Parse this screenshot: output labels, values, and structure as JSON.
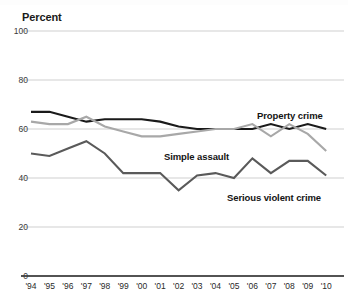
{
  "axis": {
    "ylabel": "Percent",
    "yticks": [
      100,
      80,
      60,
      40,
      20,
      0
    ],
    "xticks": [
      "'94",
      "'95",
      "'96",
      "'97",
      "'98",
      "'99",
      "'00",
      "'01",
      "'02",
      "'03",
      "'04",
      "'05",
      "'06",
      "'07",
      "'08",
      "'09",
      "'10"
    ]
  },
  "labels": {
    "property_crime": "Property crime",
    "simple_assault": "Simple assault",
    "serious_violent_crime": "Serious violent crime"
  },
  "colors": {
    "property_crime": "#1a1a1a",
    "simple_assault": "#a8a8a8",
    "serious_violent_crime": "#5a5a5a",
    "gridline": "#c9c9c9",
    "axis": "#1a1a1a"
  },
  "chart_data": {
    "type": "line",
    "title": "",
    "xlabel": "",
    "ylabel": "Percent",
    "ylim": [
      0,
      100
    ],
    "grid": true,
    "legend": "inline-annotations",
    "categories": [
      "'94",
      "'95",
      "'96",
      "'97",
      "'98",
      "'99",
      "'00",
      "'01",
      "'02",
      "'03",
      "'04",
      "'05",
      "'06",
      "'07",
      "'08",
      "'09",
      "'10"
    ],
    "series": [
      {
        "name": "Property crime",
        "color": "#1a1a1a",
        "values": [
          67,
          67,
          65,
          63,
          64,
          64,
          64,
          63,
          61,
          60,
          60,
          60,
          60,
          62,
          60,
          62,
          60
        ]
      },
      {
        "name": "Simple assault",
        "color": "#a8a8a8",
        "values": [
          63,
          62,
          62,
          65,
          61,
          59,
          57,
          57,
          58,
          59,
          60,
          60,
          62,
          57,
          62,
          58,
          51
        ]
      },
      {
        "name": "Serious violent crime",
        "color": "#5a5a5a",
        "values": [
          50,
          49,
          52,
          55,
          50,
          42,
          42,
          42,
          35,
          41,
          42,
          40,
          48,
          42,
          47,
          47,
          41
        ]
      }
    ]
  }
}
